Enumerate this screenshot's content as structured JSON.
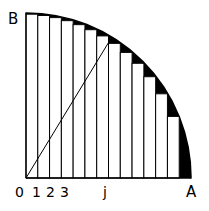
{
  "figure": {
    "colors": {
      "ink": "#000000",
      "background": "#ffffff",
      "fill_remainder": "#000000",
      "bar_fill": "#ffffff",
      "stroke": "#000000"
    },
    "geometry": {
      "origin_x": 26,
      "origin_y": 178,
      "radius": 165,
      "n_rectangles": 14,
      "bar_width": 11.7857,
      "axis_stroke_width": 1.2,
      "bar_stroke_width": 1.0,
      "arc_stroke_width": 1.6,
      "diagonal_stroke_width": 1.0,
      "diagonal_end_index": 7
    }
  },
  "labels": {
    "vertex_b": "B",
    "vertex_a": "A",
    "origin": "0",
    "tick_1": "1",
    "tick_2": "2",
    "tick_3": "3",
    "tick_j": "j"
  },
  "label_positions": {
    "vertex_b": {
      "left": 8,
      "top": 12
    },
    "vertex_a": {
      "left": 186,
      "top": 185
    },
    "origin": {
      "left": 15,
      "top": 185
    },
    "tick_1": {
      "left": 32,
      "top": 185
    },
    "tick_2": {
      "left": 46,
      "top": 185
    },
    "tick_3": {
      "left": 60,
      "top": 185
    },
    "tick_j": {
      "left": 103,
      "top": 185
    }
  },
  "chart_data": {
    "type": "area",
    "xlabel": "",
    "ylabel": "",
    "xlim": [
      0,
      14
    ],
    "ylim": [
      0,
      14
    ],
    "grid": false,
    "legend": null,
    "curve": {
      "name": "quarter-circle-arc",
      "equation": "x^2 + y^2 = r^2",
      "radius_units": 14,
      "from_point": "B",
      "to_point": "A"
    },
    "categories": [
      "1",
      "2",
      "3",
      "4",
      "5",
      "6",
      "7",
      "8",
      "9",
      "10",
      "11",
      "12",
      "13",
      "14"
    ],
    "values": [
      13.9642,
      13.8564,
      13.6748,
      13.4164,
      13.0767,
      12.6491,
      12.1244,
      11.4891,
      10.7238,
      9.798,
      8.6603,
      7.2111,
      5.2915,
      0.0
    ],
    "annotations": [
      {
        "text": "B",
        "x": 0,
        "y": 14
      },
      {
        "text": "0",
        "x": 0,
        "y": 0
      },
      {
        "text": "1",
        "x": 1,
        "y": 0
      },
      {
        "text": "2",
        "x": 2,
        "y": 0
      },
      {
        "text": "3",
        "x": 3,
        "y": 0
      },
      {
        "text": "j",
        "x": 7,
        "y": 0
      },
      {
        "text": "A",
        "x": 14,
        "y": 0
      }
    ],
    "diagonal": {
      "from": [
        0,
        0
      ],
      "to": [
        7,
        11.4891
      ]
    }
  }
}
